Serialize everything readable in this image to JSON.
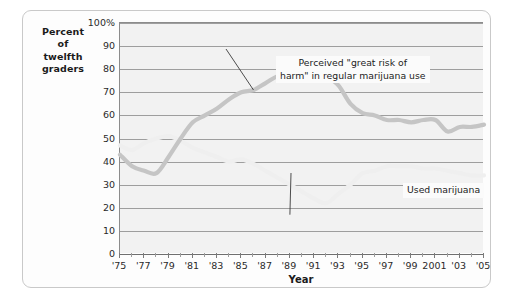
{
  "chart_data": {
    "type": "line",
    "title": "",
    "subtitle": "",
    "xlabel": "Year",
    "ylabel": "Percent of twelfth graders",
    "ylabel_lines": [
      "Percent",
      "of",
      "twelfth",
      "graders"
    ],
    "xlim": [
      1975,
      2005
    ],
    "ylim": [
      0,
      100
    ],
    "grid": true,
    "legend_position": "inline-annotations",
    "y_ticks": [
      0,
      10,
      20,
      30,
      40,
      50,
      60,
      70,
      80,
      90,
      100
    ],
    "y_ticklabels": [
      "0",
      "10",
      "20",
      "30",
      "40",
      "50",
      "60",
      "70",
      "80",
      "90",
      "100%"
    ],
    "x_ticks": [
      1975,
      1977,
      1979,
      1981,
      1983,
      1985,
      1987,
      1989,
      1991,
      1993,
      1995,
      1997,
      1999,
      2001,
      2003,
      2005
    ],
    "x_ticklabels": [
      "'75",
      "'77",
      "'79",
      "'81",
      "'83",
      "'85",
      "'87",
      "'89",
      "'91",
      "'93",
      "'95",
      "'97",
      "'99",
      "2001",
      "'03",
      "'05"
    ],
    "x": [
      1975,
      1976,
      1977,
      1978,
      1979,
      1980,
      1981,
      1982,
      1983,
      1984,
      1985,
      1986,
      1987,
      1988,
      1989,
      1990,
      1991,
      1992,
      1993,
      1994,
      1995,
      1996,
      1997,
      1998,
      1999,
      2000,
      2001,
      2002,
      2003,
      2004,
      2005
    ],
    "series": [
      {
        "name": "Perceived \"great risk of harm\" in regular marijuana use",
        "color": "#c5c5c5",
        "values": [
          43,
          38,
          36,
          35,
          42,
          50,
          57,
          60,
          63,
          67,
          70,
          71,
          74,
          77,
          78,
          78,
          79,
          77,
          73,
          65,
          61,
          60,
          58,
          58,
          57,
          58,
          58,
          53,
          55,
          55,
          56
        ]
      },
      {
        "name": "Used marijuana",
        "color": "#efefef",
        "values": [
          47,
          45,
          48,
          50,
          51,
          49,
          46,
          44,
          42,
          40,
          41,
          39,
          36,
          33,
          30,
          27,
          24,
          22,
          26,
          30,
          35,
          36,
          38,
          38,
          38,
          37,
          37,
          36,
          35,
          34,
          34
        ]
      }
    ],
    "annotations": [
      {
        "id": "risk",
        "text": "Perceived \"great risk of\nharm\" in regular marijuana use",
        "points_to_year": 1986,
        "points_to_value": 71
      },
      {
        "id": "use",
        "text": "Used marijuana",
        "points_to_year": 1989,
        "points_to_value": 17
      }
    ]
  }
}
